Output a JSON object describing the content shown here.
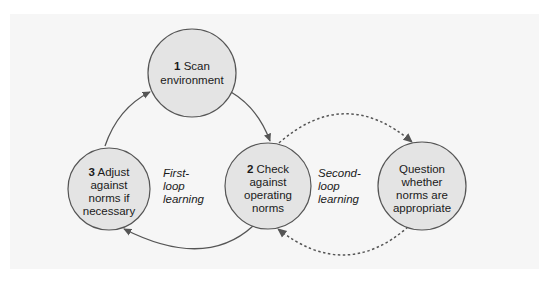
{
  "diagram": {
    "nodes": [
      {
        "id": "scan",
        "number": "1",
        "label_lines": [
          "Scan",
          "environment"
        ]
      },
      {
        "id": "check",
        "number": "2",
        "label_lines": [
          "Check",
          "against",
          "operating",
          "norms"
        ]
      },
      {
        "id": "adjust",
        "number": "3",
        "label_lines": [
          "Adjust",
          "against",
          "norms if",
          "necessary"
        ]
      },
      {
        "id": "question",
        "number": "",
        "label_lines": [
          "Question",
          "whether",
          "norms are",
          "appropriate"
        ]
      }
    ],
    "loop_labels": {
      "first": [
        "First-",
        "loop",
        "learning"
      ],
      "second": [
        "Second-",
        "loop",
        "learning"
      ]
    },
    "edges": [
      {
        "from": "adjust",
        "to": "scan",
        "style": "solid"
      },
      {
        "from": "scan",
        "to": "check",
        "style": "solid"
      },
      {
        "from": "check",
        "to": "adjust",
        "style": "solid"
      },
      {
        "from": "check",
        "to": "question",
        "style": "dashed"
      },
      {
        "from": "question",
        "to": "check",
        "style": "dashed"
      }
    ],
    "colors": {
      "node_fill": "#e4e4e4",
      "node_stroke": "#555555",
      "arrow": "#555555",
      "background": "#f6f6f6"
    }
  }
}
